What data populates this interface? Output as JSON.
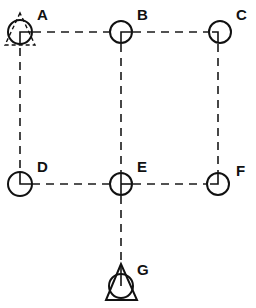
{
  "diagram": {
    "title": "",
    "nodes": [
      {
        "id": "A",
        "label": "A",
        "cx": 20,
        "cy": 32,
        "symbol": "circle-with-dashed-triangle",
        "inner": "right-down"
      },
      {
        "id": "B",
        "label": "B",
        "cx": 121,
        "cy": 32,
        "symbol": "circle",
        "inner": "horizontal-then-down"
      },
      {
        "id": "C",
        "label": "C",
        "cx": 220,
        "cy": 32,
        "symbol": "circle",
        "inner": "left-then-down"
      },
      {
        "id": "D",
        "label": "D",
        "cx": 20,
        "cy": 184,
        "symbol": "circle",
        "inner": "up-then-right"
      },
      {
        "id": "E",
        "label": "E",
        "cx": 121,
        "cy": 184,
        "symbol": "circle",
        "inner": "cross"
      },
      {
        "id": "F",
        "label": "F",
        "cx": 218,
        "cy": 184,
        "symbol": "circle",
        "inner": "up-then-left"
      },
      {
        "id": "G",
        "label": "G",
        "cx": 121,
        "cy": 286,
        "symbol": "circle-with-solid-triangle",
        "inner": "up"
      }
    ],
    "edges": [
      {
        "from": "A",
        "to": "B",
        "style": "dashed"
      },
      {
        "from": "B",
        "to": "C",
        "style": "dashed"
      },
      {
        "from": "A",
        "to": "D",
        "style": "dashed"
      },
      {
        "from": "B",
        "to": "E",
        "style": "dashed"
      },
      {
        "from": "C",
        "to": "F",
        "style": "dashed"
      },
      {
        "from": "D",
        "to": "E",
        "style": "dashed"
      },
      {
        "from": "E",
        "to": "F",
        "style": "dashed"
      },
      {
        "from": "E",
        "to": "G",
        "style": "dashed"
      }
    ],
    "colors": {
      "line": "#111111",
      "background": "#ffffff"
    }
  }
}
